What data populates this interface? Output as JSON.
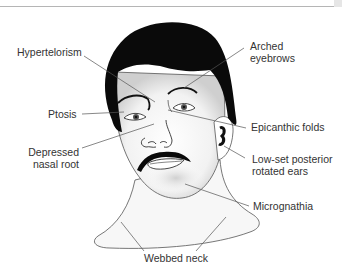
{
  "diagram": {
    "title": "",
    "colors": {
      "hair": "#0a0a0a",
      "skin": "#ffffff",
      "shadow": "#d9d9d9",
      "leader": "#555555",
      "text": "#333333",
      "rule": "#b5b5b5"
    },
    "labels": [
      {
        "id": "hypertelorism",
        "text": "Hypertelorism"
      },
      {
        "id": "arched-eyebrows",
        "line1": "Arched",
        "line2": "eyebrows"
      },
      {
        "id": "ptosis",
        "text": "Ptosis"
      },
      {
        "id": "epicanthic-folds",
        "text": "Epicanthic folds"
      },
      {
        "id": "depressed-nasal-root",
        "line1": "Depressed",
        "line2": "nasal root"
      },
      {
        "id": "low-set-ears",
        "line1": "Low-set posterior",
        "line2": "rotated ears"
      },
      {
        "id": "micrognathia",
        "text": "Micrognathia"
      },
      {
        "id": "webbed-neck",
        "text": "Webbed neck"
      }
    ]
  }
}
